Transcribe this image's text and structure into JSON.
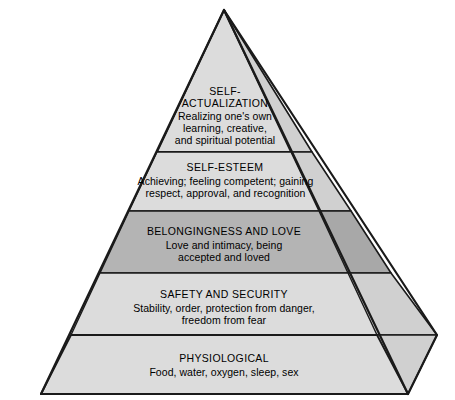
{
  "diagram": {
    "type": "pyramid-hierarchy",
    "name": "Maslow's Hierarchy of Needs",
    "orientation": "3d-right-facet",
    "background_color": "#ffffff",
    "outline_color": "#1a1a1a",
    "tier_count": 5,
    "colors": {
      "front_light": "#dcdcdc",
      "front_highlight": "#d2d2d2",
      "front_shaded": "#b4b4b4",
      "side_light": "#d0d0d0",
      "side_shaded": "#a8a8a8",
      "text": "#000000"
    },
    "tiers": [
      {
        "level": 5,
        "position": "apex",
        "title": "SELF-\nACTUALIZATION",
        "description": "Realizing one's own\nlearning, creative,\nand spiritual potential",
        "shaded": false,
        "fill": "#dcdcdc"
      },
      {
        "level": 4,
        "position": "second",
        "title": "SELF-ESTEEM",
        "description": "Achieving; feeling competent; gaining\nrespect, approval, and recognition",
        "shaded": false,
        "fill": "#dcdcdc"
      },
      {
        "level": 3,
        "position": "middle",
        "title": "BELONGINGNESS AND LOVE",
        "description": "Love and intimacy, being\naccepted and loved",
        "shaded": true,
        "fill": "#b4b4b4"
      },
      {
        "level": 2,
        "position": "fourth",
        "title": "SAFETY AND SECURITY",
        "description": "Stability, order, protection from danger,\nfreedom from fear",
        "shaded": false,
        "fill": "#dcdcdc"
      },
      {
        "level": 1,
        "position": "base",
        "title": "PHYSIOLOGICAL",
        "description": "Food, water, oxygen, sleep, sex",
        "shaded": false,
        "fill": "#dcdcdc"
      }
    ]
  }
}
